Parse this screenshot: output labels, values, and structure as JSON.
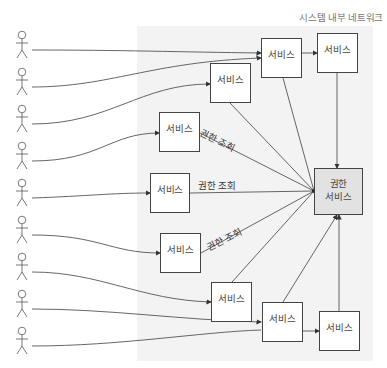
{
  "network_title": "시스템 내부 네트워크",
  "users": {
    "count": 10,
    "icon": "stick-figure-icon"
  },
  "services": [
    {
      "id": "svc-a",
      "label": "서비스"
    },
    {
      "id": "svc-b",
      "label": "서비스"
    },
    {
      "id": "svc-c",
      "label": "서비스"
    },
    {
      "id": "svc-d",
      "label": "서비스"
    },
    {
      "id": "svc-e",
      "label": "서비스"
    },
    {
      "id": "svc-f",
      "label": "서비스"
    },
    {
      "id": "svc-g",
      "label": "서비스"
    },
    {
      "id": "svc-h",
      "label": "서비스"
    },
    {
      "id": "svc-i",
      "label": "서비스"
    }
  ],
  "central_service": {
    "line1": "권한",
    "line2": "서비스"
  },
  "edge_labels": [
    "권한 조회",
    "권한 조회",
    "권한 조회"
  ],
  "colors": {
    "line": "#444444",
    "network_bg": "#f3f3f3",
    "central_fill": "#e2e2e2"
  }
}
